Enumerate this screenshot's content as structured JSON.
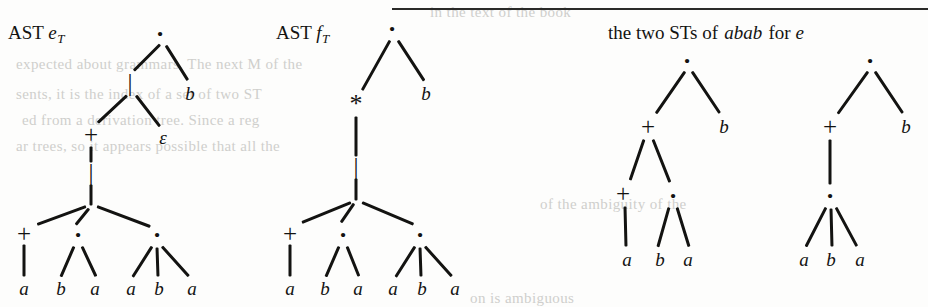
{
  "page": {
    "background_color": "#fdfdfc",
    "ink_color": "#131311",
    "rule_color": "#2a2a28"
  },
  "captions": {
    "ast_e": {
      "prefix": "AST ",
      "symbol": "e",
      "subscript": "T"
    },
    "ast_f": {
      "prefix": "AST ",
      "symbol": "f",
      "subscript": "T"
    },
    "two_sts": {
      "part1": "the two STs of ",
      "word": "abab",
      "part2": " for ",
      "symbol": "e"
    }
  },
  "bleed_text": [
    {
      "text": "in the text of the book",
      "x": 430,
      "y": 4
    },
    {
      "text": "expected about grammars. The next M of the",
      "x": 16,
      "y": 56
    },
    {
      "text": "sents, it is the index of a set of two ST",
      "x": 16,
      "y": 86
    },
    {
      "text": "ed from a derivation tree. Since a reg",
      "x": 22,
      "y": 112
    },
    {
      "text": "ar trees, so it appears possible that all the",
      "x": 16,
      "y": 138
    },
    {
      "text": "of the ambiguity of the",
      "x": 540,
      "y": 196
    },
    {
      "text": "on is ambiguous",
      "x": 470,
      "y": 290
    }
  ],
  "rule": {
    "x": 392,
    "y": 8,
    "width": 536,
    "height": 2
  },
  "trees": [
    {
      "name": "ast-e-t",
      "origin_x": 0,
      "origin_y": 0,
      "nodes": [
        {
          "id": "r",
          "label": "·",
          "kind": "sym-dot",
          "x": 160,
          "y": 34
        },
        {
          "id": "bar1",
          "label": "|",
          "kind": "sym-bar",
          "x": 130,
          "y": 82
        },
        {
          "id": "b1",
          "label": "b",
          "kind": "sym-leaf",
          "x": 190,
          "y": 93
        },
        {
          "id": "plus1",
          "label": "+",
          "kind": "sym-plus",
          "x": 91,
          "y": 134
        },
        {
          "id": "eps",
          "label": "ε",
          "kind": "sym-eps",
          "x": 163,
          "y": 137
        },
        {
          "id": "bar2",
          "label": "|",
          "kind": "sym-bar",
          "x": 91,
          "y": 172
        },
        {
          "id": "plus2",
          "label": "+",
          "kind": "sym-plus",
          "x": 24,
          "y": 233
        },
        {
          "id": "dot1",
          "label": "·",
          "kind": "sym-dot",
          "x": 78,
          "y": 235
        },
        {
          "id": "dot2",
          "label": "·",
          "kind": "sym-dot",
          "x": 157,
          "y": 235
        },
        {
          "id": "l1",
          "label": "a",
          "kind": "sym-leaf",
          "x": 24,
          "y": 288
        },
        {
          "id": "l2",
          "label": "b",
          "kind": "sym-leaf",
          "x": 61,
          "y": 288
        },
        {
          "id": "l3",
          "label": "a",
          "kind": "sym-leaf",
          "x": 95,
          "y": 288
        },
        {
          "id": "l4",
          "label": "a",
          "kind": "sym-leaf",
          "x": 131,
          "y": 288
        },
        {
          "id": "l5",
          "label": "b",
          "kind": "sym-leaf",
          "x": 159,
          "y": 288
        },
        {
          "id": "l6",
          "label": "a",
          "kind": "sym-leaf",
          "x": 192,
          "y": 288
        }
      ],
      "edges": [
        [
          160,
          44,
          134,
          70
        ],
        [
          166,
          45,
          188,
          80
        ],
        [
          127,
          95,
          98,
          122
        ],
        [
          136,
          95,
          160,
          126
        ],
        [
          91,
          146,
          91,
          162
        ],
        [
          91,
          184,
          91,
          205
        ],
        [
          86,
          206,
          37,
          224
        ],
        [
          89,
          208,
          76,
          224
        ],
        [
          97,
          206,
          150,
          226
        ],
        [
          24,
          244,
          24,
          276
        ],
        [
          74,
          246,
          61,
          276
        ],
        [
          82,
          246,
          96,
          276
        ],
        [
          152,
          246,
          133,
          276
        ],
        [
          157,
          247,
          158,
          276
        ],
        [
          162,
          246,
          189,
          276
        ]
      ]
    },
    {
      "name": "ast-f-t",
      "origin_x": 270,
      "origin_y": 0,
      "nodes": [
        {
          "id": "r",
          "label": "·",
          "kind": "sym-dot",
          "x": 122,
          "y": 29
        },
        {
          "id": "star",
          "label": "*",
          "kind": "sym-star",
          "x": 86,
          "y": 104
        },
        {
          "id": "b1",
          "label": "b",
          "kind": "sym-leaf",
          "x": 156,
          "y": 93
        },
        {
          "id": "bar",
          "label": "|",
          "kind": "sym-bar",
          "x": 86,
          "y": 166
        },
        {
          "id": "plus",
          "label": "+",
          "kind": "sym-plus",
          "x": 20,
          "y": 233
        },
        {
          "id": "dot1",
          "label": "·",
          "kind": "sym-dot",
          "x": 73,
          "y": 235
        },
        {
          "id": "dot2",
          "label": "·",
          "kind": "sym-dot",
          "x": 150,
          "y": 235
        },
        {
          "id": "l1",
          "label": "a",
          "kind": "sym-leaf",
          "x": 20,
          "y": 288
        },
        {
          "id": "l2",
          "label": "b",
          "kind": "sym-leaf",
          "x": 55,
          "y": 288
        },
        {
          "id": "l3",
          "label": "a",
          "kind": "sym-leaf",
          "x": 88,
          "y": 288
        },
        {
          "id": "l4",
          "label": "a",
          "kind": "sym-leaf",
          "x": 123,
          "y": 288
        },
        {
          "id": "l5",
          "label": "b",
          "kind": "sym-leaf",
          "x": 152,
          "y": 288
        },
        {
          "id": "l6",
          "label": "a",
          "kind": "sym-leaf",
          "x": 185,
          "y": 288
        }
      ],
      "edges": [
        [
          120,
          40,
          92,
          90
        ],
        [
          128,
          40,
          154,
          80
        ],
        [
          86,
          116,
          86,
          156
        ],
        [
          86,
          178,
          86,
          200
        ],
        [
          81,
          202,
          32,
          222
        ],
        [
          84,
          203,
          71,
          222
        ],
        [
          92,
          202,
          144,
          224
        ],
        [
          20,
          244,
          20,
          276
        ],
        [
          69,
          246,
          56,
          276
        ],
        [
          77,
          246,
          89,
          276
        ],
        [
          145,
          246,
          126,
          276
        ],
        [
          150,
          247,
          151,
          276
        ],
        [
          155,
          246,
          182,
          276
        ]
      ]
    },
    {
      "name": "st-1",
      "origin_x": 600,
      "origin_y": 0,
      "nodes": [
        {
          "id": "r",
          "label": "·",
          "kind": "sym-dot",
          "x": 87,
          "y": 61
        },
        {
          "id": "plus1",
          "label": "+",
          "kind": "sym-plus",
          "x": 48,
          "y": 126
        },
        {
          "id": "b1",
          "label": "b",
          "kind": "sym-leaf",
          "x": 124,
          "y": 126
        },
        {
          "id": "plus2",
          "label": "+",
          "kind": "sym-plus",
          "x": 23,
          "y": 193
        },
        {
          "id": "dot1",
          "label": "·",
          "kind": "sym-dot",
          "x": 73,
          "y": 196
        },
        {
          "id": "l1",
          "label": "a",
          "kind": "sym-leaf",
          "x": 27,
          "y": 259
        },
        {
          "id": "l2",
          "label": "b",
          "kind": "sym-leaf",
          "x": 60,
          "y": 259
        },
        {
          "id": "l3",
          "label": "a",
          "kind": "sym-leaf",
          "x": 88,
          "y": 259
        }
      ],
      "edges": [
        [
          85,
          71,
          56,
          113
        ],
        [
          92,
          71,
          120,
          113
        ],
        [
          44,
          139,
          30,
          180
        ],
        [
          53,
          139,
          70,
          182
        ],
        [
          25,
          206,
          26,
          246
        ],
        [
          69,
          207,
          58,
          246
        ],
        [
          77,
          207,
          89,
          246
        ]
      ]
    },
    {
      "name": "st-2",
      "origin_x": 770,
      "origin_y": 0,
      "nodes": [
        {
          "id": "r",
          "label": "·",
          "kind": "sym-dot",
          "x": 100,
          "y": 61
        },
        {
          "id": "plus",
          "label": "+",
          "kind": "sym-plus",
          "x": 60,
          "y": 126
        },
        {
          "id": "b1",
          "label": "b",
          "kind": "sym-leaf",
          "x": 136,
          "y": 126
        },
        {
          "id": "dot1",
          "label": "·",
          "kind": "sym-dot",
          "x": 60,
          "y": 196
        },
        {
          "id": "l1",
          "label": "a",
          "kind": "sym-leaf",
          "x": 34,
          "y": 259
        },
        {
          "id": "l2",
          "label": "b",
          "kind": "sym-leaf",
          "x": 61,
          "y": 259
        },
        {
          "id": "l3",
          "label": "a",
          "kind": "sym-leaf",
          "x": 90,
          "y": 259
        }
      ],
      "edges": [
        [
          98,
          71,
          68,
          113
        ],
        [
          105,
          71,
          133,
          113
        ],
        [
          60,
          139,
          60,
          184
        ],
        [
          56,
          207,
          36,
          246
        ],
        [
          61,
          208,
          62,
          246
        ],
        [
          66,
          207,
          87,
          246
        ]
      ]
    }
  ]
}
